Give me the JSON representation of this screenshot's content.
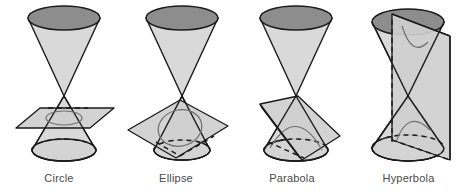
{
  "figure": {
    "background_color": "#ffffff",
    "width": 467,
    "height": 192
  },
  "colors": {
    "cone_body": "#d9d9d9",
    "cone_cap": "#8d8d8d",
    "cone_base": "#d4d4d4",
    "plane": "#cfcfcf",
    "outline": "#1a1a1a",
    "conic_curve": "#6f6f6f",
    "caption_text": "#4a4a4a"
  },
  "panels": [
    {
      "id": "circle",
      "label": "Circle",
      "plane_orientation": "horizontal",
      "cut_description": "plane perpendicular to the cone axis cuts one nappe",
      "curve_type": "closed circle",
      "left": 0,
      "width": 118
    },
    {
      "id": "ellipse",
      "label": "Ellipse",
      "plane_orientation": "oblique, tilted",
      "cut_description": "tilted plane cuts entirely through one nappe",
      "curve_type": "closed ellipse",
      "left": 118,
      "width": 116
    },
    {
      "id": "parabola",
      "label": "Parabola",
      "plane_orientation": "parallel to a slant edge",
      "cut_description": "plane parallel to one generating line of the cone",
      "curve_type": "open parabola",
      "left": 234,
      "width": 116
    },
    {
      "id": "hyperbola",
      "label": "Hyperbola",
      "plane_orientation": "vertical, parallel to the axis",
      "cut_description": "vertical plane cuts both nappes of the double cone",
      "curve_type": "two open branches",
      "left": 350,
      "width": 117
    }
  ]
}
